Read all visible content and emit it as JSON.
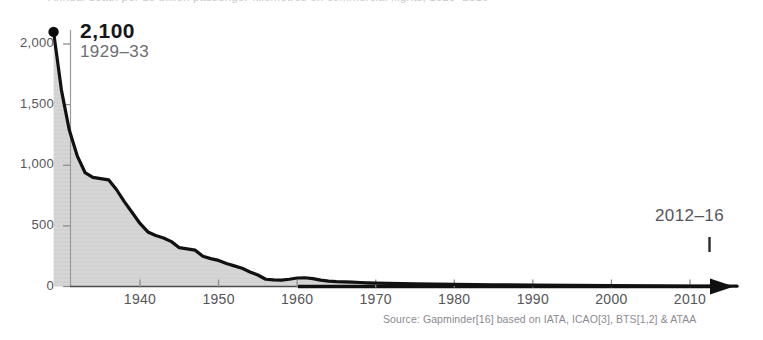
{
  "figure": {
    "cut_caption": "Annual death per 10 billion passenger-kilometres on commercial flights, 1929–2016",
    "source_note": "Source: Gapminder[16] based on IATA, ICAO[3], BTS[1,2] & ATAA",
    "peak_value_label": "2,100",
    "peak_period_label": "1929–33",
    "end_period_label": "2012–16"
  },
  "chart_data": {
    "type": "area",
    "title": "",
    "xlabel": "",
    "ylabel": "",
    "xlim": [
      1929,
      2016
    ],
    "ylim": [
      0,
      2100
    ],
    "grid": false,
    "legend": null,
    "y_ticks": [
      "0",
      "500",
      "1,000",
      "1,500",
      "2,000"
    ],
    "y_tick_values": [
      0,
      500,
      1000,
      1500,
      2000
    ],
    "x_ticks": [
      "1940",
      "1950",
      "1960",
      "1970",
      "1980",
      "1990",
      "2000",
      "2010"
    ],
    "x_tick_values": [
      1940,
      1950,
      1960,
      1970,
      1980,
      1990,
      2000,
      2010
    ],
    "annotations": [
      {
        "text": "2,100",
        "x": 1929,
        "y": 2100,
        "marker": "dot"
      },
      {
        "text": "1929–33",
        "x": 1929,
        "y": 2100,
        "marker": "none"
      },
      {
        "text": "2012–16",
        "x": 2014,
        "y": 0,
        "marker": "tick"
      }
    ],
    "x": [
      1929,
      1930,
      1931,
      1932,
      1933,
      1934,
      1935,
      1936,
      1937,
      1938,
      1939,
      1940,
      1941,
      1942,
      1943,
      1944,
      1945,
      1946,
      1947,
      1948,
      1949,
      1950,
      1951,
      1952,
      1953,
      1954,
      1955,
      1956,
      1957,
      1958,
      1959,
      1960,
      1961,
      1962,
      1963,
      1964,
      1965,
      1966,
      1967,
      1968,
      1969,
      1970,
      1975,
      1980,
      1985,
      1990,
      1995,
      2000,
      2005,
      2010,
      2016
    ],
    "values": [
      2100,
      1620,
      1290,
      1080,
      940,
      900,
      890,
      880,
      800,
      700,
      610,
      520,
      450,
      420,
      400,
      370,
      320,
      310,
      300,
      250,
      230,
      215,
      190,
      170,
      150,
      120,
      95,
      60,
      55,
      52,
      60,
      70,
      72,
      65,
      52,
      45,
      40,
      38,
      36,
      33,
      30,
      28,
      22,
      18,
      14,
      11,
      9,
      7,
      5,
      4,
      3
    ],
    "series": [
      {
        "name": "Deaths per 10 billion passenger-km",
        "fill": "#d6d6d6",
        "stroke": "#111111"
      }
    ]
  },
  "colors": {
    "area_fill": "#d6d6d6",
    "line_stroke": "#111111",
    "axis": "#1a1a1a",
    "tick_text": "#555558",
    "annotation_muted": "#6d6d72",
    "source_text": "#8a8a90",
    "background": "#ffffff"
  }
}
